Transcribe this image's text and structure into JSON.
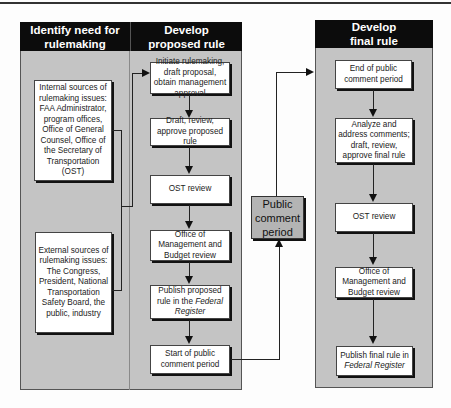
{
  "columns": {
    "identify": {
      "title": "Identify need for\nrulemaking"
    },
    "proposed": {
      "title": "Develop\nproposed rule"
    },
    "final": {
      "title": "Develop\nfinal rule"
    }
  },
  "sources": {
    "internal": "Internal sources of rulemaking issues: FAA Administrator, program offices, Office of General Counsel, Office of the Secretary of Transportation (OST)",
    "external": "External sources of rulemaking issues: The Congress, President, National Transportation Safety Board, the public, industry"
  },
  "proposed_steps": [
    {
      "text": "Initiate rulemaking, draft proposal, obtain management approval"
    },
    {
      "text": "Draft, review, approve proposed rule"
    },
    {
      "text": "OST review"
    },
    {
      "text": "Office of Management and Budget review"
    },
    {
      "text": "Publish proposed rule in the ",
      "italic": "Federal Register"
    },
    {
      "text": "Start of public comment period"
    }
  ],
  "public_comment": {
    "text": "Public comment period"
  },
  "final_steps": [
    {
      "text": "End of public comment period"
    },
    {
      "text": "Analyze and address comments; draft, review, approve final rule"
    },
    {
      "text": "OST review"
    },
    {
      "text": "Office of Management and Budget review"
    },
    {
      "text": "Publish final rule in ",
      "italic": "Federal Register"
    }
  ],
  "colors": {
    "header_bg": "#0c0c0c",
    "panel_bg": "#c4c4c4",
    "box_bg": "#ffffff",
    "public_comment_bg": "#b4b4b4"
  }
}
